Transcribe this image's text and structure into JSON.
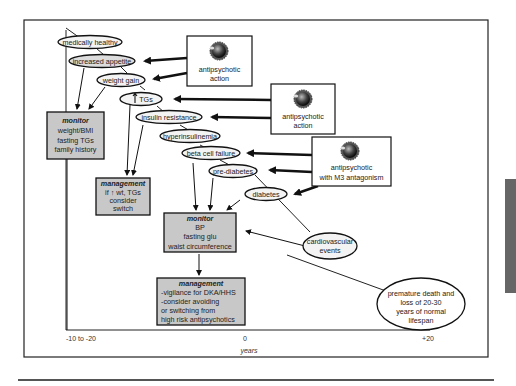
{
  "diagram": {
    "nodes": {
      "medically_healthy": "medically healthy",
      "increased_appetite": "increased appetite",
      "weight_gain": "weight gain",
      "tgs": "TGs",
      "insulin_resistance": "insulin resistance",
      "hyperinsulinemia": "hyperinsulinemia",
      "beta_cell_failure": "beta cell failure",
      "pre_diabetes": "pre-diabetes",
      "diabetes": "diabetes",
      "cardiovascular_1": "cardiovascular",
      "cardiovascular_2": "events",
      "premature_1": "premature death and",
      "premature_2": "loss of 20-30",
      "premature_3": "years of normal",
      "premature_4": "lifespan"
    },
    "drug_boxes": [
      {
        "line1": "antipsychotic",
        "line2": "action"
      },
      {
        "line1": "antipsychotic",
        "line2": "action"
      },
      {
        "line1": "antipsychotic",
        "line2": "with M3 antagonism"
      }
    ],
    "monitor_1": {
      "title": "monitor",
      "lines": [
        "weight/BMI",
        "fasting TGs",
        "family history"
      ]
    },
    "management_1": {
      "title": "management",
      "lines": [
        "if ↑ wt, TGs",
        "consider",
        "switch"
      ]
    },
    "monitor_2": {
      "title": "monitor",
      "lines": [
        "BP",
        "fasting glu",
        "waist circumference"
      ]
    },
    "management_2": {
      "title": "management",
      "lines": [
        "-vigilance for DKA/HHS",
        "-consider avoiding",
        "or switching from",
        "high risk antipsychotics"
      ]
    },
    "axis": {
      "left_label": "-10 to -20",
      "center_label": "0",
      "right_label": "+20",
      "title": "years"
    }
  },
  "colors": {
    "box_fill": "#c8c8c8",
    "ellipse_fill": "#ececec",
    "line": "#111111",
    "side_bar": "#666666"
  }
}
